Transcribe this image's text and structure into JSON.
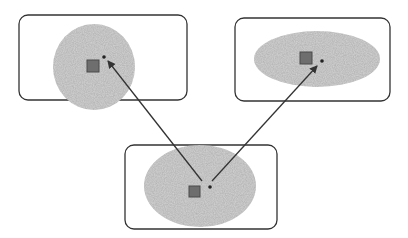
{
  "diagram": {
    "colors": {
      "background": "#ffffff",
      "box_stroke": "#333333",
      "ellipse_fill": "#d4d4d4",
      "square_fill": "#6e6e6e",
      "square_stroke": "#4a4a4a",
      "dot_fill": "#222222",
      "arrow": "#333333"
    },
    "panels": [
      {
        "id": "top-left",
        "box": {
          "x": 19,
          "y": 15,
          "w": 168,
          "h": 85
        },
        "ellipse": {
          "cx": 94,
          "cy": 67,
          "rx": 41,
          "ry": 43
        },
        "square": {
          "x": 87,
          "y": 60,
          "size": 12
        },
        "dot": {
          "cx": 104,
          "cy": 57
        }
      },
      {
        "id": "top-right",
        "box": {
          "x": 235,
          "y": 18,
          "w": 155,
          "h": 83
        },
        "ellipse": {
          "cx": 317,
          "cy": 59,
          "rx": 63,
          "ry": 28
        },
        "square": {
          "x": 300,
          "y": 52,
          "size": 12
        },
        "dot": {
          "cx": 322,
          "cy": 61
        }
      },
      {
        "id": "bottom",
        "box": {
          "x": 125,
          "y": 145,
          "w": 152,
          "h": 84
        },
        "ellipse": {
          "cx": 200,
          "cy": 186,
          "rx": 56,
          "ry": 41
        },
        "square": {
          "x": 189,
          "y": 186,
          "size": 11
        },
        "dot": {
          "cx": 210,
          "cy": 187
        }
      }
    ],
    "arrows": [
      {
        "from": "bottom",
        "to": "top-left",
        "x1": 202,
        "y1": 181,
        "x2": 108,
        "y2": 61
      },
      {
        "from": "bottom",
        "to": "top-right",
        "x1": 212,
        "y1": 181,
        "x2": 317,
        "y2": 66
      }
    ]
  }
}
